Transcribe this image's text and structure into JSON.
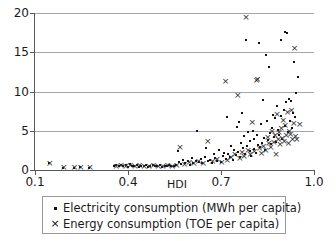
{
  "chart_data": {
    "type": "scatter",
    "title": "",
    "xlabel": "HDI",
    "ylabel": "",
    "xlim": [
      0.1,
      1.0
    ],
    "ylim": [
      0,
      20
    ],
    "xticks": [
      "0.1",
      "0.4",
      "0.7",
      "1.0"
    ],
    "xtick_values": [
      0.1,
      0.4,
      0.7,
      1.0
    ],
    "yticks": [
      "0",
      "5",
      "10",
      "15",
      "20"
    ],
    "ytick_values": [
      0,
      5,
      10,
      15,
      20
    ],
    "grid": "horizontal",
    "legend_position": "below-axis",
    "series": [
      {
        "name": "Electricity consumption (MWh per capita)",
        "marker": "square",
        "color": "#111111",
        "points": [
          [
            0.145,
            0.85
          ],
          [
            0.19,
            0.3
          ],
          [
            0.225,
            0.3
          ],
          [
            0.245,
            0.35
          ],
          [
            0.275,
            0.3
          ],
          [
            0.355,
            0.55
          ],
          [
            0.362,
            0.6
          ],
          [
            0.37,
            0.45
          ],
          [
            0.378,
            0.7
          ],
          [
            0.385,
            0.5
          ],
          [
            0.392,
            0.6
          ],
          [
            0.4,
            0.4
          ],
          [
            0.405,
            0.75
          ],
          [
            0.412,
            0.5
          ],
          [
            0.42,
            0.45
          ],
          [
            0.428,
            0.6
          ],
          [
            0.435,
            0.35
          ],
          [
            0.442,
            0.55
          ],
          [
            0.45,
            0.5
          ],
          [
            0.458,
            0.65
          ],
          [
            0.465,
            0.4
          ],
          [
            0.472,
            0.55
          ],
          [
            0.48,
            0.6
          ],
          [
            0.488,
            0.45
          ],
          [
            0.495,
            0.5
          ],
          [
            0.502,
            0.7
          ],
          [
            0.51,
            0.4
          ],
          [
            0.518,
            0.55
          ],
          [
            0.525,
            0.5
          ],
          [
            0.532,
            0.6
          ],
          [
            0.54,
            0.45
          ],
          [
            0.548,
            0.55
          ],
          [
            0.555,
            0.65
          ],
          [
            0.56,
            2.4
          ],
          [
            0.565,
            1.0
          ],
          [
            0.572,
            0.8
          ],
          [
            0.578,
            1.3
          ],
          [
            0.585,
            0.9
          ],
          [
            0.592,
            1.1
          ],
          [
            0.6,
            0.7
          ],
          [
            0.605,
            1.5
          ],
          [
            0.61,
            0.95
          ],
          [
            0.618,
            1.2
          ],
          [
            0.622,
            5.0
          ],
          [
            0.628,
            1.0
          ],
          [
            0.635,
            1.4
          ],
          [
            0.64,
            0.85
          ],
          [
            0.648,
            1.6
          ],
          [
            0.652,
            2.8
          ],
          [
            0.658,
            1.1
          ],
          [
            0.665,
            1.3
          ],
          [
            0.67,
            0.9
          ],
          [
            0.678,
            2.1
          ],
          [
            0.682,
            1.5
          ],
          [
            0.688,
            1.2
          ],
          [
            0.695,
            2.5
          ],
          [
            0.7,
            1.0
          ],
          [
            0.705,
            1.8
          ],
          [
            0.71,
            2.2
          ],
          [
            0.715,
            1.4
          ],
          [
            0.72,
            6.8
          ],
          [
            0.722,
            2.0
          ],
          [
            0.728,
            1.6
          ],
          [
            0.732,
            3.1
          ],
          [
            0.738,
            1.3
          ],
          [
            0.742,
            2.6
          ],
          [
            0.748,
            1.9
          ],
          [
            0.752,
            5.5
          ],
          [
            0.755,
            2.3
          ],
          [
            0.758,
            6.1
          ],
          [
            0.762,
            1.7
          ],
          [
            0.765,
            3.4
          ],
          [
            0.768,
            7.3
          ],
          [
            0.772,
            2.8
          ],
          [
            0.775,
            4.3
          ],
          [
            0.778,
            2.1
          ],
          [
            0.782,
            16.5
          ],
          [
            0.785,
            3.0
          ],
          [
            0.788,
            4.9
          ],
          [
            0.792,
            2.4
          ],
          [
            0.795,
            3.7
          ],
          [
            0.798,
            1.8
          ],
          [
            0.802,
            5.0
          ],
          [
            0.805,
            2.7
          ],
          [
            0.808,
            3.9
          ],
          [
            0.812,
            2.2
          ],
          [
            0.815,
            4.5
          ],
          [
            0.818,
            3.2
          ],
          [
            0.822,
            16.2
          ],
          [
            0.825,
            2.9
          ],
          [
            0.828,
            5.8
          ],
          [
            0.832,
            3.5
          ],
          [
            0.835,
            8.9
          ],
          [
            0.838,
            4.1
          ],
          [
            0.842,
            2.6
          ],
          [
            0.845,
            14.7
          ],
          [
            0.848,
            6.3
          ],
          [
            0.852,
            3.8
          ],
          [
            0.855,
            13.1
          ],
          [
            0.858,
            4.7
          ],
          [
            0.862,
            3.3
          ],
          [
            0.865,
            5.4
          ],
          [
            0.868,
            7.0
          ],
          [
            0.872,
            4.2
          ],
          [
            0.875,
            6.6
          ],
          [
            0.878,
            3.6
          ],
          [
            0.882,
            8.2
          ],
          [
            0.885,
            5.1
          ],
          [
            0.888,
            4.4
          ],
          [
            0.892,
            16.5
          ],
          [
            0.895,
            6.9
          ],
          [
            0.898,
            3.9
          ],
          [
            0.902,
            7.6
          ],
          [
            0.905,
            5.6
          ],
          [
            0.908,
            17.6
          ],
          [
            0.91,
            8.6
          ],
          [
            0.912,
            17.5
          ],
          [
            0.915,
            4.8
          ],
          [
            0.918,
            9.1
          ],
          [
            0.922,
            6.2
          ],
          [
            0.925,
            8.8
          ],
          [
            0.928,
            5.3
          ],
          [
            0.932,
            7.2
          ],
          [
            0.935,
            13.7
          ],
          [
            0.938,
            6.7
          ],
          [
            0.942,
            9.8
          ],
          [
            0.948,
            11.8
          ]
        ]
      },
      {
        "name": "Energy consumption (TOE per capita)",
        "marker": "cross",
        "color": "#2b2b2b",
        "points": [
          [
            0.145,
            0.9
          ],
          [
            0.19,
            0.35
          ],
          [
            0.225,
            0.35
          ],
          [
            0.245,
            0.4
          ],
          [
            0.275,
            0.35
          ],
          [
            0.36,
            0.55
          ],
          [
            0.375,
            0.6
          ],
          [
            0.39,
            0.5
          ],
          [
            0.405,
            0.65
          ],
          [
            0.42,
            0.5
          ],
          [
            0.435,
            0.6
          ],
          [
            0.45,
            0.55
          ],
          [
            0.465,
            0.5
          ],
          [
            0.48,
            0.6
          ],
          [
            0.495,
            0.55
          ],
          [
            0.51,
            0.5
          ],
          [
            0.525,
            0.6
          ],
          [
            0.54,
            0.55
          ],
          [
            0.555,
            0.65
          ],
          [
            0.565,
            2.9
          ],
          [
            0.58,
            0.8
          ],
          [
            0.595,
            1.0
          ],
          [
            0.61,
            0.85
          ],
          [
            0.625,
            1.2
          ],
          [
            0.64,
            0.9
          ],
          [
            0.655,
            3.7
          ],
          [
            0.67,
            1.1
          ],
          [
            0.685,
            1.4
          ],
          [
            0.7,
            1.0
          ],
          [
            0.712,
            11.4
          ],
          [
            0.718,
            1.3
          ],
          [
            0.73,
            1.6
          ],
          [
            0.742,
            2.0
          ],
          [
            0.752,
            9.5
          ],
          [
            0.758,
            1.5
          ],
          [
            0.765,
            2.3
          ],
          [
            0.772,
            1.8
          ],
          [
            0.778,
            19.5
          ],
          [
            0.785,
            2.6
          ],
          [
            0.792,
            2.0
          ],
          [
            0.798,
            6.1
          ],
          [
            0.805,
            2.4
          ],
          [
            0.812,
            11.5
          ],
          [
            0.815,
            11.6
          ],
          [
            0.822,
            2.8
          ],
          [
            0.828,
            2.2
          ],
          [
            0.835,
            3.1
          ],
          [
            0.842,
            2.6
          ],
          [
            0.848,
            4.2
          ],
          [
            0.852,
            3.4
          ],
          [
            0.858,
            2.9
          ],
          [
            0.862,
            5.0
          ],
          [
            0.868,
            3.6
          ],
          [
            0.872,
            4.5
          ],
          [
            0.875,
            2.1
          ],
          [
            0.878,
            7.1
          ],
          [
            0.882,
            3.9
          ],
          [
            0.885,
            4.8
          ],
          [
            0.888,
            3.3
          ],
          [
            0.892,
            5.3
          ],
          [
            0.895,
            4.1
          ],
          [
            0.898,
            6.4
          ],
          [
            0.902,
            3.7
          ],
          [
            0.905,
            5.7
          ],
          [
            0.908,
            4.4
          ],
          [
            0.912,
            7.4
          ],
          [
            0.915,
            3.5
          ],
          [
            0.918,
            5.0
          ],
          [
            0.922,
            4.6
          ],
          [
            0.925,
            7.7
          ],
          [
            0.928,
            4.0
          ],
          [
            0.932,
            6.0
          ],
          [
            0.935,
            15.5
          ],
          [
            0.938,
            4.3
          ],
          [
            0.942,
            3.9
          ],
          [
            0.952,
            5.8
          ]
        ]
      }
    ]
  },
  "legend": {
    "entries": [
      {
        "marker_glyph": "square",
        "label": "Electricity consumption (MWh per capita)"
      },
      {
        "marker_glyph": "cross",
        "label": "Energy consumption (TOE per capita)"
      }
    ]
  }
}
